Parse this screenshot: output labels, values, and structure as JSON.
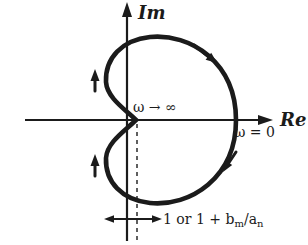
{
  "figure": {
    "type": "nyquist-polar-plot",
    "im_axis_label": "Im",
    "re_axis_label": "Re",
    "omega_infinity_label": "ω → ∞",
    "omega_zero_label": "ω = 0",
    "distance_label": {
      "part1": "1 or 1 + b",
      "sub1": "m",
      "part2": "/a",
      "sub2": "n",
      "full_text": "1 or 1 + bm/an"
    },
    "colors": {
      "ink": "#1b1b1b",
      "background": "#ffffff"
    }
  }
}
